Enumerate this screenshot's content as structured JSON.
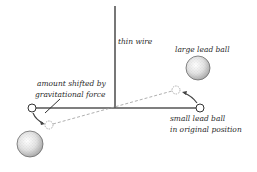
{
  "diagram": {
    "labels": {
      "wire": "thin wire",
      "large_ball": "large lead ball",
      "shift_line1": "amount shifted by",
      "shift_line2": "gravitational force",
      "small_ball_line1": "small lead ball",
      "small_ball_line2": "in original position"
    },
    "colors": {
      "wire": "#555555",
      "bar": "#555555",
      "dashed": "#9a9a9a",
      "text": "#2a2a2a",
      "large_ball_fill": "#d8d8d8",
      "large_ball_edge": "#6a6a6a"
    }
  }
}
